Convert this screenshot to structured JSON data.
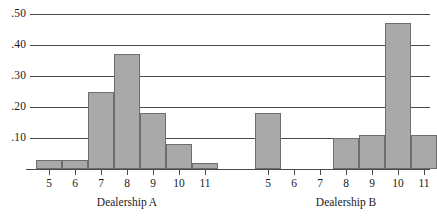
{
  "chart_data": {
    "type": "bar",
    "title": "",
    "subtitle": "",
    "xlabel": "",
    "ylabel": "",
    "ylim": [
      0,
      0.5
    ],
    "grid": true,
    "legend_position": "none",
    "ytick_labels": [
      ".10",
      ".20",
      ".30",
      ".40",
      ".50"
    ],
    "ytick_values": [
      0.1,
      0.2,
      0.3,
      0.4,
      0.5
    ],
    "groups": [
      {
        "name": "Dealership A",
        "label": "Dealership A",
        "categories": [
          "5",
          "6",
          "7",
          "8",
          "9",
          "10",
          "11"
        ],
        "values": [
          0.03,
          0.03,
          0.25,
          0.37,
          0.18,
          0.08,
          0.02
        ]
      },
      {
        "name": "Dealership B",
        "label": "Dealership B",
        "categories": [
          "5",
          "6",
          "7",
          "8",
          "9",
          "10",
          "11"
        ],
        "values": [
          0.18,
          0.0,
          0.0,
          0.1,
          0.11,
          0.47,
          0.11
        ]
      }
    ],
    "colors": {
      "bar_fill": "#a9a9a9",
      "bar_stroke": "#6e6e6e",
      "gridline": "#4a4a4a",
      "axis": "#4a4a4a",
      "text": "#1a1a1a",
      "background": "#ffffff"
    }
  }
}
